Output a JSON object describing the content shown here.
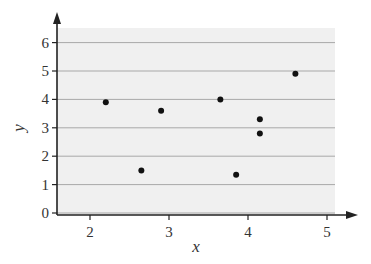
{
  "chart_data": {
    "type": "scatter",
    "title": "",
    "xlabel": "x",
    "ylabel": "y",
    "xlim": [
      1.6,
      5.1
    ],
    "ylim": [
      0,
      6.4
    ],
    "x_ticks": [
      2,
      3,
      4,
      5
    ],
    "y_ticks": [
      0,
      1,
      2,
      3,
      4,
      5,
      6
    ],
    "grid": {
      "horizontal": true,
      "vertical": false
    },
    "background": "#f0f0f0",
    "point_color": "#111111",
    "points": [
      {
        "x": 2.2,
        "y": 3.9
      },
      {
        "x": 2.65,
        "y": 1.5
      },
      {
        "x": 2.9,
        "y": 3.6
      },
      {
        "x": 3.65,
        "y": 4.0
      },
      {
        "x": 3.85,
        "y": 1.35
      },
      {
        "x": 4.15,
        "y": 3.3
      },
      {
        "x": 4.15,
        "y": 2.8
      },
      {
        "x": 4.6,
        "y": 4.9
      }
    ]
  }
}
